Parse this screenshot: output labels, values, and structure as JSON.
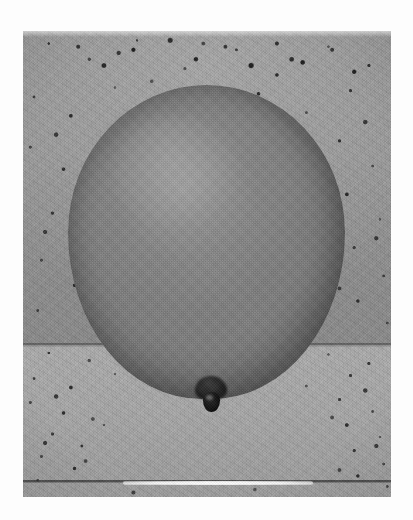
{
  "page": {
    "title": "Balloon Photograph",
    "canvas_width": 413,
    "canvas_height": 520,
    "background_color": "#fdfdfd",
    "media_type": "grayscale photograph"
  },
  "photo": {
    "name": "balloon-photograph",
    "alt_text": "Grayscale photograph of a large inflated balloon resting on a speckled terrazzo floor",
    "frame": {
      "left": 23,
      "top": 31,
      "width": 368,
      "height": 466
    },
    "is_grayscale": true,
    "tone_range": {
      "darkest": "#050505",
      "lightest": "#ffffff"
    }
  },
  "scene": {
    "background": {
      "name": "terrazzo-floor",
      "description": "speckled granite or terrazzo flooring with dark flecks",
      "upper_slab_color": "#a0a0a0",
      "lower_slab_color": "#a9a9a9",
      "fleck_color": "#1a1a1a",
      "fleck_density_upper": "high",
      "fleck_density_lower": "medium"
    },
    "joints": [
      {
        "name": "tile-joint-middle",
        "y": 345,
        "color": "#5f5f5f",
        "has_highlight": false
      },
      {
        "name": "tile-joint-lower",
        "y": 481,
        "color": "#464646",
        "has_highlight": true
      }
    ],
    "specular_highlight": {
      "name": "specular-streak",
      "description": "bright white reflected highlight along the lower tile joint",
      "color": "#ffffff",
      "x_start": 123,
      "x_end": 313,
      "y": 481
    }
  },
  "subject": {
    "name": "balloon",
    "shape": "oval egg-shaped inflated balloon",
    "body_color": "#7d7d7d",
    "edge_shadow_color": "#505050",
    "highlight_color": "#bebebe",
    "bounds": {
      "left": 68,
      "top": 85,
      "right": 345,
      "bottom": 398
    },
    "center_x": 206,
    "width": 277,
    "height": 314,
    "knot": {
      "name": "balloon-knot",
      "color": "#101010",
      "bounds": {
        "left": 193,
        "top": 376,
        "right": 229,
        "bottom": 416
      },
      "description": "dark tied knot protruding from the bottom of the balloon"
    }
  }
}
